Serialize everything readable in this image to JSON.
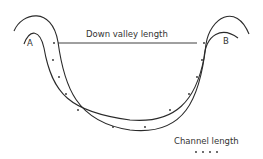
{
  "diagram": {
    "labels": {
      "start": "A",
      "end": "B",
      "down_valley": "Down valley length",
      "channel": "Channel length"
    },
    "colors": {
      "line": "#2a2a2a",
      "text": "#333333"
    }
  }
}
